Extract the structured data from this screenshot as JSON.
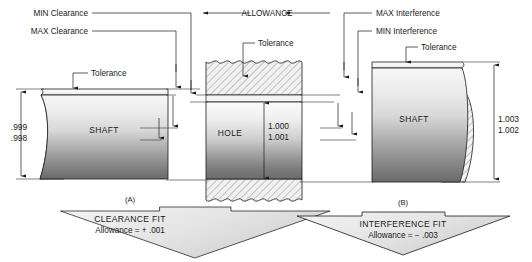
{
  "diagram": {
    "title_labels": {
      "min_clearance": "MIN Clearance",
      "max_clearance": "MAX Clearance",
      "allowance": "ALLOWANCE",
      "max_interference": "MAX Interference",
      "min_interference": "MIN Interference",
      "tolerance_left": "Tolerance",
      "tolerance_center": "Tolerance",
      "tolerance_right": "Tolerance"
    },
    "left_part": {
      "name": "SHAFT",
      "dim_upper": ".999",
      "dim_lower": ".998"
    },
    "center_part": {
      "name": "HOLE",
      "dim_upper": "1.000",
      "dim_lower": "1.001"
    },
    "right_part": {
      "name": "SHAFT",
      "dim_upper": "1.003",
      "dim_lower": "1.002"
    },
    "figures": {
      "left": "(A)",
      "right": "(B)"
    },
    "banners": [
      {
        "title": "CLEARANCE FIT",
        "subtitle": "Allowance = + .001"
      },
      {
        "title": "INTERFERENCE FIT",
        "subtitle": "Allowance = − .003"
      }
    ],
    "colors": {
      "line": "#1a1a1a",
      "text": "#1a1a1a",
      "metal_light": "#f2f2f2",
      "metal_dark": "#6e6e6e",
      "hatch": "#6b6b6b",
      "banner_fill": "#e8e8e8"
    }
  }
}
